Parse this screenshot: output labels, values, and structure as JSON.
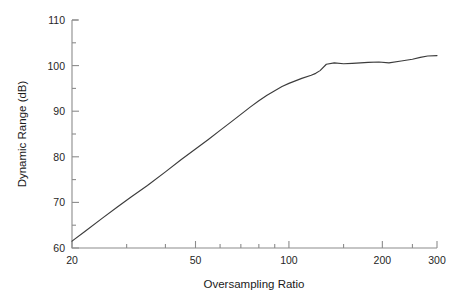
{
  "chart_data": {
    "type": "line",
    "title": "",
    "xlabel": "Oversampling Ratio",
    "ylabel": "Dynamic Range (dB)",
    "xscale": "log",
    "yscale": "linear",
    "xlim": [
      20,
      300
    ],
    "ylim": [
      60,
      110
    ],
    "grid": false,
    "legend": null,
    "xticks_major": [
      20,
      50,
      100,
      200,
      300
    ],
    "xtick_labels": [
      "20",
      "50",
      "100",
      "200",
      "300"
    ],
    "xticks_minor": [
      30,
      40,
      60,
      70,
      80,
      90,
      150,
      250
    ],
    "yticks_major": [
      60,
      70,
      80,
      90,
      100,
      110
    ],
    "ytick_labels": [
      "60",
      "70",
      "80",
      "90",
      "100",
      "110"
    ],
    "yticks_minor": [
      65,
      75,
      85,
      95,
      105
    ],
    "line_color": "#3c3c3c",
    "axis_color": "#8c8c8c",
    "series": [
      {
        "name": "Dynamic Range",
        "x": [
          20,
          22,
          25,
          28,
          31,
          35,
          40,
          45,
          50,
          55,
          60,
          65,
          70,
          75,
          80,
          85,
          90,
          95,
          100,
          110,
          118,
          122,
          126,
          132,
          140,
          150,
          160,
          170,
          180,
          195,
          210,
          230,
          250,
          265,
          280,
          300
        ],
        "y": [
          61.5,
          63.6,
          66.5,
          69.0,
          71.2,
          73.7,
          76.7,
          79.4,
          81.7,
          83.8,
          85.8,
          87.6,
          89.3,
          90.9,
          92.3,
          93.5,
          94.5,
          95.4,
          96.1,
          97.2,
          97.9,
          98.3,
          98.9,
          100.3,
          100.6,
          100.4,
          100.5,
          100.6,
          100.7,
          100.8,
          100.6,
          101.0,
          101.4,
          101.8,
          102.1,
          102.2
        ]
      }
    ]
  },
  "figure": {
    "xlabel": "Oversampling Ratio",
    "ylabel": "Dynamic Range (dB)"
  }
}
